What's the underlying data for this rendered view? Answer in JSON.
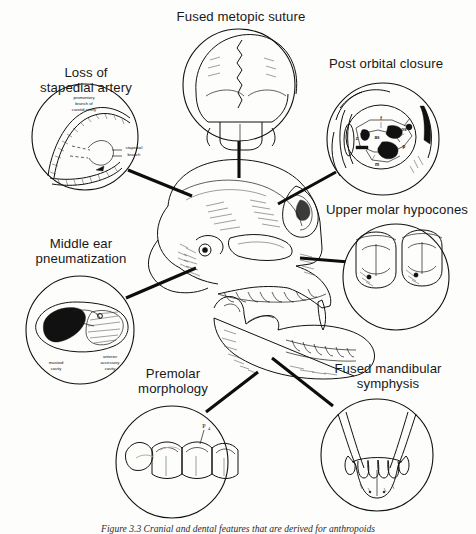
{
  "figure": {
    "title_caption": "Figure 3.3   Cranial and dental features that are derived for anthropoids",
    "central_subject": "anthropoid primate skull, lateral view with detached mandible"
  },
  "callouts": [
    {
      "id": "stapedial",
      "label": "Loss of\nstapedial artery",
      "label_lines": [
        "Loss of",
        "stapedial artery"
      ],
      "inner_labels": [
        "promontory",
        "branch of",
        "carotid artery",
        "stapedial",
        "branch"
      ],
      "circle": {
        "cx": 85,
        "cy": 137,
        "r": 53
      }
    },
    {
      "id": "metopic",
      "label": "Fused metopic suture",
      "label_lines": [
        "Fused metopic suture"
      ],
      "inner_labels": [],
      "circle": {
        "cx": 239,
        "cy": 85,
        "r": 56
      }
    },
    {
      "id": "postorbital",
      "label": "Post orbital closure",
      "label_lines": [
        "Post orbital closure"
      ],
      "inner_labels": [
        "f",
        "os",
        "as",
        "z",
        "p",
        "m"
      ],
      "circle": {
        "cx": 383,
        "cy": 139,
        "r": 56
      }
    },
    {
      "id": "hypocones",
      "label": "Upper molar hypocones",
      "label_lines": [
        "Upper molar hypocones"
      ],
      "inner_labels": [],
      "circle": {
        "cx": 396,
        "cy": 277,
        "r": 53
      }
    },
    {
      "id": "pneumatization",
      "label": "Middle ear\npneumatization",
      "label_lines": [
        "Middle ear",
        "pneumatization"
      ],
      "inner_labels": [
        "mastoid",
        "cavity",
        "anterior",
        "accessory",
        "cavity"
      ],
      "circle": {
        "cx": 80,
        "cy": 330,
        "r": 54
      }
    },
    {
      "id": "premolar",
      "label": "Premolar\nmorphology",
      "label_lines": [
        "Premolar",
        "morphology"
      ],
      "inner_labels": [
        "P",
        "4"
      ],
      "circle": {
        "cx": 172,
        "cy": 462,
        "r": 56
      }
    },
    {
      "id": "symphysis",
      "label": "Fused mandibular\nsymphysis",
      "label_lines": [
        "Fused mandibular",
        "symphysis"
      ],
      "inner_labels": [],
      "circle": {
        "cx": 377,
        "cy": 455,
        "r": 56
      }
    }
  ],
  "labels": {
    "stapedial_l1": "Loss of",
    "stapedial_l2": "stapedial artery",
    "metopic": "Fused metopic suture",
    "postorbital": "Post orbital closure",
    "hypocones": "Upper molar hypocones",
    "pneum_l1": "Middle ear",
    "pneum_l2": "pneumatization",
    "premolar_l1": "Premolar",
    "premolar_l2": "morphology",
    "symphysis_l1": "Fused mandibular",
    "symphysis_l2": "symphysis",
    "inner": {
      "promontory1": "promontory",
      "promontory2": "branch of",
      "promontory3": "carotid artery",
      "stapedial_branch1": "stapedial",
      "stapedial_branch2": "branch",
      "mastoid1": "mastoid",
      "mastoid2": "cavity",
      "accessory1": "anterior",
      "accessory2": "accessory",
      "accessory3": "cavity",
      "bone_f": "f",
      "bone_os": "os",
      "bone_as": "as",
      "bone_z": "z",
      "bone_p": "p",
      "bone_m": "m",
      "premolar_tooth": "P",
      "premolar_sub": "4"
    }
  },
  "colors": {
    "ink": "#111111",
    "paper": "#fdfdfb",
    "leader": "#0d0d0d"
  },
  "caption_text": "Figure 3.3   Cranial and dental features that are derived for anthropoids"
}
